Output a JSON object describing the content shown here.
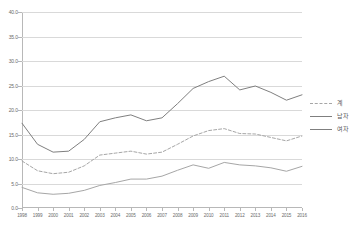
{
  "chart_data": {
    "type": "line",
    "title": "",
    "xlabel": "",
    "ylabel": "",
    "ylim": [
      0.0,
      40.0
    ],
    "grid": true,
    "legend_position": "right",
    "y_ticks": [
      "40.0",
      "35.0",
      "30.0",
      "25.0",
      "20.0",
      "15.0",
      "10.0",
      "5.0",
      "0.0"
    ],
    "categories": [
      "1998",
      "1999",
      "2000",
      "2001",
      "2002",
      "2003",
      "2004",
      "2005",
      "2006",
      "2007",
      "2008",
      "2009",
      "2010",
      "2011",
      "2012",
      "2013",
      "2014",
      "2015",
      "2016"
    ],
    "series": [
      {
        "name": "계",
        "style": "dashed",
        "color": "#a6a6a6",
        "values": [
          9.6,
          7.6,
          7.0,
          7.3,
          8.6,
          10.8,
          11.2,
          11.6,
          11.0,
          11.4,
          13.0,
          14.7,
          15.8,
          16.2,
          15.2,
          15.1,
          14.4,
          13.7,
          14.7
        ]
      },
      {
        "name": "남자",
        "style": "solid",
        "color": "#7f7f7f",
        "values": [
          17.3,
          13.0,
          11.4,
          11.6,
          14.0,
          17.6,
          18.4,
          19.0,
          17.8,
          18.4,
          21.3,
          24.4,
          25.8,
          26.9,
          24.1,
          24.9,
          23.6,
          22.0,
          23.1
        ]
      },
      {
        "name": "여자",
        "style": "solid",
        "color": "#a6a6a6",
        "values": [
          4.2,
          3.1,
          2.8,
          3.0,
          3.6,
          4.6,
          5.2,
          5.9,
          5.9,
          6.5,
          7.7,
          8.8,
          8.1,
          9.3,
          8.8,
          8.6,
          8.2,
          7.5,
          8.5
        ]
      }
    ]
  },
  "legend": {
    "items": [
      {
        "label": "계"
      },
      {
        "label": "남자"
      },
      {
        "label": "여자"
      }
    ]
  }
}
